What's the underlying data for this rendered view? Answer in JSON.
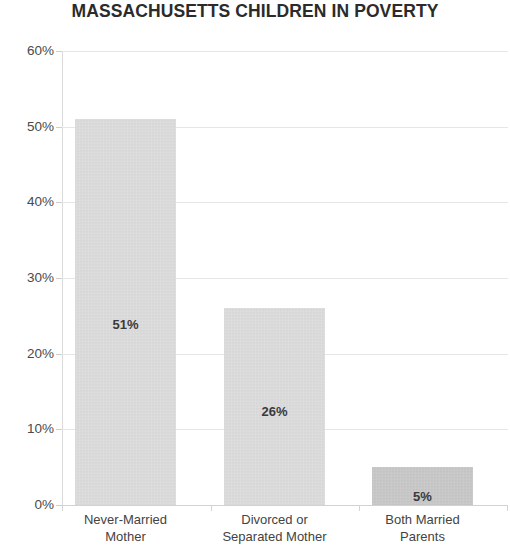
{
  "chart_data": {
    "type": "bar",
    "title": "MASSACHUSETTS CHILDREN IN POVERTY",
    "subtitle": "",
    "xlabel": "",
    "ylabel": "",
    "categories": [
      "Never-Married Mother",
      "Divorced or Separated Mother",
      "Both Married Parents"
    ],
    "category_lines": [
      [
        "Never-Married",
        "Mother"
      ],
      [
        "Divorced or",
        "Separated Mother"
      ],
      [
        "Both Married",
        "Parents"
      ]
    ],
    "values": [
      51,
      26,
      5
    ],
    "value_labels": [
      "51%",
      "26%",
      "5%"
    ],
    "ylim": [
      0,
      60
    ],
    "ytick_values": [
      0,
      10,
      20,
      30,
      40,
      50,
      60
    ],
    "ytick_labels": [
      "0%",
      "10%",
      "20%",
      "30%",
      "40%",
      "50%",
      "60%"
    ],
    "grid": true,
    "legend": false,
    "legend_position": "none",
    "bar_colors": [
      "#dddddd",
      "#dddddd",
      "#c9c9c9"
    ],
    "title_color": "#2b2b2b",
    "gridline_color": "#e6e6e6",
    "axis_color": "#dadada",
    "label_color": "#4a4a4a"
  }
}
